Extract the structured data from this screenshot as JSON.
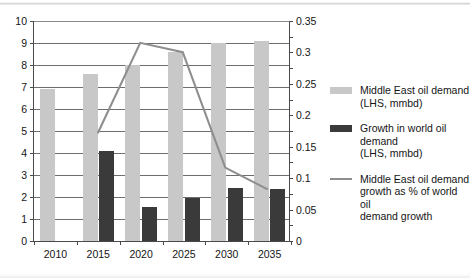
{
  "chart_data": {
    "type": "bar",
    "title": "",
    "subtitle": "",
    "xlabel": "",
    "ylabel": "",
    "y2label": "",
    "categories": [
      "2010",
      "2015",
      "2020",
      "2025",
      "2030",
      "2035"
    ],
    "grid": true,
    "legend_position": "right",
    "axes": {
      "left": {
        "min": 0,
        "max": 10,
        "step": 1,
        "ticks": [
          "0",
          "1",
          "2",
          "3",
          "4",
          "5",
          "6",
          "7",
          "8",
          "9",
          "10"
        ]
      },
      "right": {
        "min": 0,
        "max": 0.35,
        "step": 0.05,
        "ticks": [
          "0",
          "0.05",
          "0.1",
          "0.15",
          "0.2",
          "0.25",
          "0.3",
          "0.35"
        ]
      }
    },
    "series": [
      {
        "name": "Middle East oil demand (LHS, mmbd)",
        "type": "bar",
        "axis": "left",
        "color": "#c8c8c8",
        "values": [
          6.9,
          7.6,
          8.0,
          8.6,
          9.0,
          9.1
        ]
      },
      {
        "name": "Growth in world oil demand (LHS, mmbd)",
        "type": "bar",
        "axis": "left",
        "color": "#3a3a3a",
        "values": [
          null,
          4.1,
          1.55,
          1.95,
          2.4,
          2.35
        ]
      },
      {
        "name": "Middle East oil demand growth as % of world oil demand growth",
        "type": "line",
        "axis": "right",
        "color": "#8e8e8e",
        "values": [
          null,
          0.17,
          0.315,
          0.3,
          0.115,
          0.08
        ]
      }
    ]
  },
  "legend": {
    "items": [
      {
        "marker": "light-swatch",
        "label": "Middle East oil demand\n(LHS, mmbd)"
      },
      {
        "marker": "dark-swatch",
        "label": "Growth in world oil demand\n(LHS, mmbd)"
      },
      {
        "marker": "line-swatch",
        "label": "Middle East oil demand\ngrowth as % of world oil\ndemand growth"
      }
    ]
  }
}
